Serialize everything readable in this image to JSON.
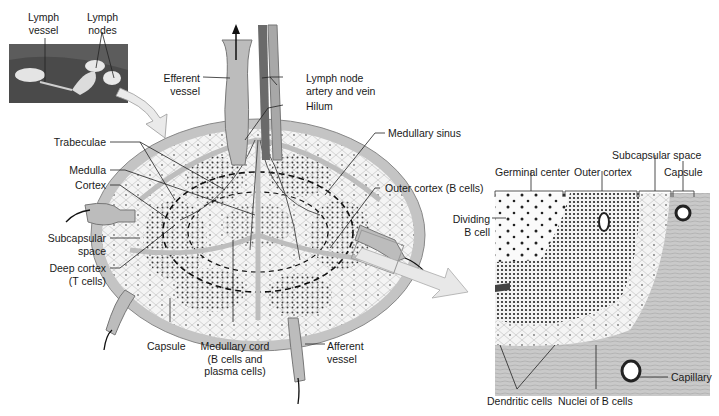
{
  "figure": {
    "inset_photo": {
      "labels": [
        "Lymph vessel",
        "Lymph nodes"
      ]
    },
    "main_section": {
      "labels": {
        "efferent_vessel": "Efferent vessel",
        "artery_vein": "Lymph node artery and vein",
        "hilum": "Hilum",
        "trabeculae": "Trabeculae",
        "medulla": "Medulla",
        "cortex": "Cortex",
        "subcapsular_space": "Subcapsular space",
        "deep_cortex": "Deep cortex (T cells)",
        "medullary_sinus": "Medullary sinus",
        "outer_cortex": "Outer cortex (B cells)",
        "capsule": "Capsule",
        "medullary_cord": "Medullary cord (B cells and plasma cells)",
        "afferent_vessel": "Afferent vessel"
      }
    },
    "micro_detail": {
      "labels": {
        "germinal_center": "Germinal center",
        "outer_cortex": "Outer cortex",
        "subcapsular_space": "Subcapsular space",
        "capsule": "Capsule",
        "dividing_b_cell": "Dividing B cell",
        "capillary": "Capillary",
        "dendritic_cells": "Dendritic cells",
        "nuclei_b_cells": "Nuclei of B cells"
      }
    }
  },
  "text": {
    "lymph_vessel_1": "Lymph",
    "lymph_vessel_2": "vessel",
    "lymph_nodes_1": "Lymph",
    "lymph_nodes_2": "nodes",
    "efferent_1": "Efferent",
    "efferent_2": "vessel",
    "artery_1": "Lymph node",
    "artery_2": "artery and vein",
    "hilum": "Hilum",
    "trabeculae": "Trabeculae",
    "medulla": "Medulla",
    "cortex": "Cortex",
    "subcap_1": "Subcapsular",
    "subcap_2": "space",
    "deep_1": "Deep cortex",
    "deep_2": "(T cells)",
    "med_sinus": "Medullary sinus",
    "outer_cortex_b": "Outer cortex (B cells)",
    "capsule": "Capsule",
    "med_cord_1": "Medullary cord",
    "med_cord_2": "(B cells and",
    "med_cord_3": "plasma cells)",
    "afferent_1": "Afferent",
    "afferent_2": "vessel",
    "germinal": "Germinal center",
    "outer_cortex": "Outer cortex",
    "subcap_space": "Subcapsular space",
    "capsule_r": "Capsule",
    "dividing_1": "Dividing",
    "dividing_2": "B cell",
    "capillary": "Capillary",
    "dendritic": "Dendritic cells",
    "nuclei": "Nuclei of B cells"
  },
  "colors": {
    "capsule": "#b9b9b9",
    "cortex_fill": "#e6e6e6",
    "dots": "#2a2a2a",
    "vessel": "#9a9a9a",
    "photo_bg": "#5a5a5a",
    "arrow_fill": "#e8e8e8"
  }
}
